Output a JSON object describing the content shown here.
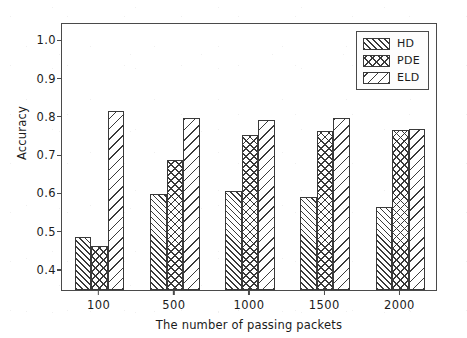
{
  "chart_data": {
    "type": "bar",
    "title": "",
    "xlabel": "The number of passing packets",
    "ylabel": "Accuracy",
    "categories": [
      "100",
      "500",
      "1000",
      "1500",
      "2000"
    ],
    "series": [
      {
        "name": "HD",
        "values": [
          0.483,
          0.595,
          0.603,
          0.588,
          0.563
        ],
        "hatch": "////"
      },
      {
        "name": "PDE",
        "values": [
          0.46,
          0.684,
          0.75,
          0.761,
          0.764
        ],
        "hatch": "xxxx"
      },
      {
        "name": "ELD",
        "values": [
          0.812,
          0.794,
          0.79,
          0.794,
          0.765
        ],
        "hatch": "\\\\\\\\"
      }
    ],
    "ylim": [
      0.345,
      1.045
    ],
    "yticks": [
      0.4,
      0.5,
      0.6,
      0.7,
      0.8,
      0.9,
      1.0
    ],
    "ytick_labels": [
      "0.4",
      "0.5",
      "0.6",
      "0.7",
      "0.8",
      "0.9",
      "1.0"
    ],
    "grid": false,
    "legend_position": "upper right",
    "legend_entries": [
      "HD",
      "PDE",
      "ELD"
    ],
    "colors": {
      "bar_face": "#ffffff",
      "bar_edge": "#3a3a3a",
      "axis": "#4a4a4a",
      "text": "#1b1b1b",
      "background": "#ffffff"
    }
  }
}
